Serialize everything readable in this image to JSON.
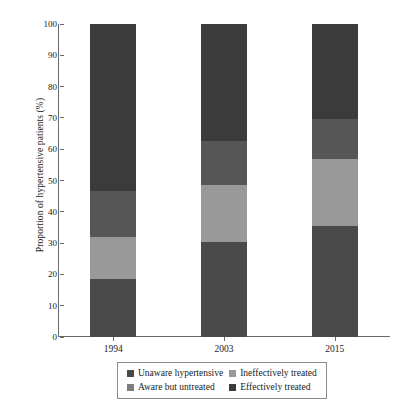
{
  "chart_data": {
    "type": "bar",
    "subtype": "stacked-bar",
    "title": "",
    "xlabel": "",
    "ylabel": "Proportion of hypertensive patients (%)",
    "categories": [
      "1994",
      "2003",
      "2015"
    ],
    "ylim": [
      0,
      100
    ],
    "yticks": [
      0,
      10,
      20,
      30,
      40,
      50,
      60,
      70,
      80,
      90,
      100
    ],
    "grid": false,
    "legend_position": "bottom",
    "stack_order_bottom_to_top": [
      "Unaware hypertensive",
      "Aware but untreated",
      "Ineffectively treated",
      "Effectively treated"
    ],
    "series": [
      {
        "name": "Unaware hypertensive",
        "color": "#4a4a4a",
        "values": [
          18.5,
          30.5,
          35.5
        ]
      },
      {
        "name": "Aware but untreated",
        "color": "#999999",
        "values": [
          13.5,
          18.0,
          21.5
        ]
      },
      {
        "name": "Ineffectively treated",
        "color": "#565656",
        "values": [
          14.5,
          14.0,
          12.5
        ]
      },
      {
        "name": "Effectively treated",
        "color": "#3b3b3b",
        "values": [
          53.5,
          37.5,
          30.5
        ]
      }
    ],
    "cumulative_boundaries": {
      "1994": [
        18.5,
        32.0,
        46.5,
        100
      ],
      "2003": [
        30.5,
        48.5,
        62.5,
        100
      ],
      "2015": [
        35.5,
        57.0,
        69.5,
        100
      ]
    }
  },
  "legend": {
    "entries": [
      {
        "label": "Unaware hypertensive",
        "color": "#4a4a4a"
      },
      {
        "label": "Ineffectively treated",
        "color": "#999999"
      },
      {
        "label": "Aware but untreated",
        "color": "#7d7d7d"
      },
      {
        "label": "Effectively treated",
        "color": "#3b3b3b"
      }
    ]
  },
  "axis": {
    "y_title": "Proportion of hypertensive patients (%)",
    "y_tick_labels": [
      "100",
      "90",
      "80",
      "70",
      "60",
      "50",
      "40",
      "30",
      "20",
      "10",
      "0"
    ],
    "x_tick_labels": [
      "1994",
      "2003",
      "2015"
    ]
  }
}
